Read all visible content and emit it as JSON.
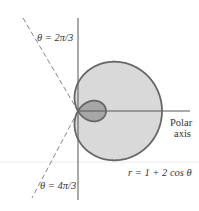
{
  "chart_data": {
    "type": "line",
    "subtype": "polar-curve",
    "title": "",
    "equation_label": "r = 1 + 2 cos θ",
    "equation": {
      "form": "r = a + b*cos(theta)",
      "a": 1,
      "b": 2
    },
    "reference_lines": [
      {
        "label": "θ = 2π/3",
        "theta": 2.0943951,
        "style": "dashed"
      },
      {
        "label": "θ = 4π/3",
        "theta": 4.1887902,
        "style": "dashed"
      }
    ],
    "axis_label": "Polar axis",
    "axis_label_lines": [
      "Polar",
      "axis"
    ],
    "features": {
      "outer_loop_max_r": 3,
      "inner_loop_tip_r": 1,
      "inner_loop_shaded": true,
      "outer_region_shaded": true
    },
    "grid": false,
    "legend": null
  },
  "labels": {
    "theta_upper": "θ = 2π/3",
    "theta_lower": "θ = 4π/3",
    "polar": "Polar",
    "axis": "axis",
    "equation": "r = 1 + 2 cos θ"
  },
  "colors": {
    "outer_fill": "#d9d9d9",
    "inner_fill": "#a6a6a6",
    "stroke": "#666666",
    "axis": "#555555",
    "dashed": "#777777",
    "text": "#333333"
  },
  "geometry": {
    "pole_x": 78,
    "pole_y": 111,
    "scale": 28
  }
}
